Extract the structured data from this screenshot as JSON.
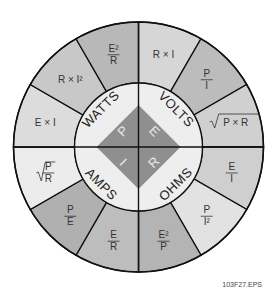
{
  "diagram": {
    "center": {
      "quadrants": [
        {
          "unit": "WATTS",
          "letter": "P"
        },
        {
          "unit": "VOLTS",
          "letter": "E"
        },
        {
          "unit": "OHMS",
          "letter": "R"
        },
        {
          "unit": "AMPS",
          "letter": "I"
        }
      ]
    },
    "segments": [
      {
        "formula": "R × I",
        "quantity": "VOLTS",
        "shade": "#d6d6d6"
      },
      {
        "formula": "P / I",
        "quantity": "VOLTS",
        "shade": "#bcbcbc"
      },
      {
        "formula": "√(P × R)",
        "quantity": "VOLTS",
        "shade": "#d0d0d0"
      },
      {
        "formula": "E / I",
        "quantity": "OHMS",
        "shade": "#cfcfcf"
      },
      {
        "formula": "P / I²",
        "quantity": "OHMS",
        "shade": "#e2e2e2"
      },
      {
        "formula": "E² / P",
        "quantity": "OHMS",
        "shade": "#b4b4b4"
      },
      {
        "formula": "E / R",
        "quantity": "AMPS",
        "shade": "#bdbdbd"
      },
      {
        "formula": "P / E",
        "quantity": "AMPS",
        "shade": "#b0b0b0"
      },
      {
        "formula": "√(P / R)",
        "quantity": "AMPS",
        "shade": "#ececec"
      },
      {
        "formula": "E × I",
        "quantity": "WATTS",
        "shade": "#dcdcdc"
      },
      {
        "formula": "R × I²",
        "quantity": "WATTS",
        "shade": "#c8c8c8"
      },
      {
        "formula": "E² / R",
        "quantity": "WATTS",
        "shade": "#b8b8b8"
      }
    ],
    "colors": {
      "diamond": "#8f8f8f",
      "inner_ring": "#eeeeee",
      "stroke": "#111111"
    },
    "figure_id": "103F27.EPS"
  }
}
